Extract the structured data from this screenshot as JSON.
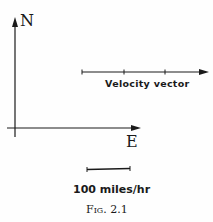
{
  "figure": {
    "axes": {
      "north_label": "N",
      "east_label": "E"
    },
    "vector": {
      "label": "Velocity vector",
      "length_units": 3,
      "magnitude_mph": 300,
      "direction": "East"
    },
    "scale": {
      "label": "100 miles/hr"
    },
    "caption": "Fig. 2.1",
    "colors": {
      "ink": "#1a1a1a",
      "background": "#fefefe"
    }
  }
}
